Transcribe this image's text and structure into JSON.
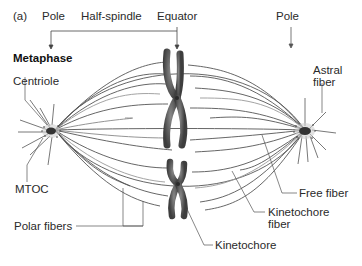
{
  "figure": {
    "panel_label": "(a)",
    "phase_title": "Metaphase",
    "top_labels": {
      "pole_left": "Pole",
      "half_spindle": "Half-spindle",
      "equator": "Equator",
      "pole_right": "Pole"
    },
    "callouts": {
      "centriole": "Centriole",
      "mtoc": "MTOC",
      "polar_fibers": "Polar fibers",
      "astral_fiber_line1": "Astral",
      "astral_fiber_line2": "fiber",
      "free_fiber": "Free fiber",
      "kinetochore_fiber_line1": "Kinetochore",
      "kinetochore_fiber_line2": "fiber",
      "kinetochore": "Kinetochore"
    },
    "colors": {
      "fiber": "#555555",
      "fiber_light": "#999999",
      "chromosome": "#6a6a6a",
      "chromosome_dark": "#3a3a3a",
      "text": "#2a2a2a"
    }
  }
}
